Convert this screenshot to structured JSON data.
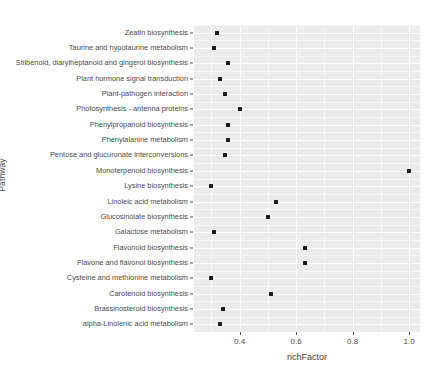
{
  "chart_data": {
    "type": "scatter",
    "title": "",
    "xlabel": "richFactor",
    "ylabel": "Pathway",
    "xlim": [
      0.2385,
      1.0385
    ],
    "xticks": [
      0.4,
      0.6,
      0.8,
      1.0
    ],
    "xtick_labels": [
      "0.4",
      "0.6",
      "0.8",
      "1.0"
    ],
    "grid": true,
    "legend": "none",
    "point_color": "#1a1a1a",
    "panel_background": "#ebebeb",
    "gridline_color": "#ffffff",
    "categories": [
      "Zeatin biosynthesis",
      "Taurine and hypotaurine metabolism",
      "Stilbenoid, diarylheptanoid and gingerol biosynthesis",
      "Plant hormone signal transduction",
      "Plant-pathogen interaction",
      "Photosynthesis - antenna proteins",
      "Phenylpropanoid biosynthesis",
      "Phenylalanine metabolism",
      "Pentose and glucuronate interconversions",
      "Monoterpenoid biosynthesis",
      "Lysine biosynthesis",
      "Linoleic acid metabolism",
      "Glucosinolate biosynthesis",
      "Galactose metabolism",
      "Flavonoid biosynthesis",
      "Flavone and flavonol biosynthesis",
      "Cysteine and methionine metabolism",
      "Carotenoid biosynthesis",
      "Brassinosteroid biosynthesis",
      "alpha-Linolenic acid metabolism"
    ],
    "values": [
      0.32,
      0.31,
      0.36,
      0.33,
      0.35,
      0.4,
      0.36,
      0.36,
      0.35,
      1.0,
      0.3,
      0.53,
      0.5,
      0.31,
      0.63,
      0.63,
      0.3,
      0.51,
      0.34,
      0.33
    ],
    "points": [
      {
        "pathway": "Zeatin biosynthesis",
        "richFactor": 0.32
      },
      {
        "pathway": "Taurine and hypotaurine metabolism",
        "richFactor": 0.31
      },
      {
        "pathway": "Stilbenoid, diarylheptanoid and gingerol biosynthesis",
        "richFactor": 0.36
      },
      {
        "pathway": "Plant hormone signal transduction",
        "richFactor": 0.33
      },
      {
        "pathway": "Plant-pathogen interaction",
        "richFactor": 0.35
      },
      {
        "pathway": "Photosynthesis - antenna proteins",
        "richFactor": 0.4
      },
      {
        "pathway": "Phenylpropanoid biosynthesis",
        "richFactor": 0.36
      },
      {
        "pathway": "Phenylalanine metabolism",
        "richFactor": 0.36
      },
      {
        "pathway": "Pentose and glucuronate interconversions",
        "richFactor": 0.35
      },
      {
        "pathway": "Monoterpenoid biosynthesis",
        "richFactor": 1.0
      },
      {
        "pathway": "Lysine biosynthesis",
        "richFactor": 0.3
      },
      {
        "pathway": "Linoleic acid metabolism",
        "richFactor": 0.53
      },
      {
        "pathway": "Glucosinolate biosynthesis",
        "richFactor": 0.5
      },
      {
        "pathway": "Galactose metabolism",
        "richFactor": 0.31
      },
      {
        "pathway": "Flavonoid biosynthesis",
        "richFactor": 0.63
      },
      {
        "pathway": "Flavone and flavonol biosynthesis",
        "richFactor": 0.63
      },
      {
        "pathway": "Cysteine and methionine metabolism",
        "richFactor": 0.3
      },
      {
        "pathway": "Carotenoid biosynthesis",
        "richFactor": 0.51
      },
      {
        "pathway": "Brassinosteroid biosynthesis",
        "richFactor": 0.34
      },
      {
        "pathway": "alpha-Linolenic acid metabolism",
        "richFactor": 0.33
      }
    ]
  }
}
